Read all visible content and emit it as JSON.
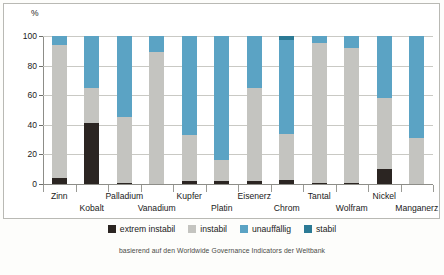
{
  "chart_data": {
    "type": "bar",
    "subtype": "stacked-100-percent",
    "title": "",
    "xlabel": "",
    "ylabel": "%",
    "ylim": [
      0,
      100
    ],
    "yticks": [
      0,
      20,
      40,
      60,
      80,
      100
    ],
    "grid": true,
    "legend_position": "bottom",
    "categories": [
      "Zinn",
      "Kobalt",
      "Palladium",
      "Vanadium",
      "Kupfer",
      "Platin",
      "Eisenerz",
      "Chrom",
      "Tantal",
      "Wolfram",
      "Nickel",
      "Manganerz"
    ],
    "series": [
      {
        "name": "extrem instabil",
        "color": "#2b2522",
        "values": [
          4,
          41,
          1,
          0,
          2,
          2,
          2,
          3,
          1,
          1,
          10,
          0
        ]
      },
      {
        "name": "instabil",
        "color": "#c4c4c0",
        "values": [
          90,
          24,
          44,
          89,
          31,
          14,
          63,
          31,
          94,
          91,
          48,
          31
        ]
      },
      {
        "name": "unauffällig",
        "color": "#5ba3c4",
        "values": [
          6,
          35,
          55,
          11,
          67,
          84,
          35,
          63,
          5,
          8,
          42,
          69
        ]
      },
      {
        "name": "stabil",
        "color": "#2b7a95",
        "values": [
          0,
          0,
          0,
          0,
          0,
          0,
          0,
          3,
          0,
          0,
          0,
          0
        ]
      }
    ],
    "source_note": "basierend auf den Worldwide Governance Indicators der Weltbank"
  },
  "axis": {
    "y_unit": "%",
    "y_tick_labels": [
      "100",
      "80",
      "60",
      "40",
      "20",
      "0"
    ]
  },
  "legend": {
    "items": [
      {
        "label": "extrem instabil",
        "color": "#2b2522"
      },
      {
        "label": "instabil",
        "color": "#c4c4c0"
      },
      {
        "label": "unauffällig",
        "color": "#5ba3c4"
      },
      {
        "label": "stabil",
        "color": "#2b7a95"
      }
    ]
  },
  "footer": {
    "source": "basierend auf den Worldwide Governance Indicators der Weltbank"
  }
}
